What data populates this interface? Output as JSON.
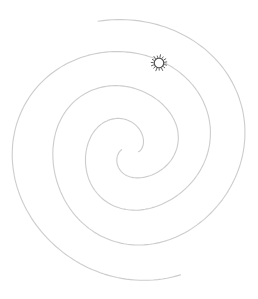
{
  "figure": {
    "type": "two-arm-spiral",
    "canvas": {
      "width": 258,
      "height": 299
    },
    "center": {
      "x": 130.5,
      "y": 151
    },
    "total_deg": 700,
    "arms": [
      {
        "name": "arm-a",
        "end_angle_deg": 104,
        "end_radius": 132,
        "sweep_deg": 652,
        "wobble": [
          [
            3.5,
            0.018,
            1.2
          ],
          [
            1.8,
            0.05,
            4.1
          ]
        ]
      },
      {
        "name": "arm-b",
        "end_angle_deg": -68,
        "end_radius": 136,
        "sweep_deg": 658,
        "wobble": [
          [
            4.5,
            0.017,
            5.0
          ],
          [
            2.0,
            0.046,
            1.9
          ]
        ]
      }
    ],
    "sun": {
      "cx": 159,
      "cy": 63,
      "radius": 4.8,
      "tick_inner": 5.9,
      "tick_outer": 7.8,
      "tick_count": 15,
      "tick_phase": 8
    },
    "colors": {
      "background": "#ffffff",
      "spiral_line": "#c9c9c9",
      "sun_stroke": "#4f4f4f",
      "sun_fill": "#ffffff"
    }
  }
}
